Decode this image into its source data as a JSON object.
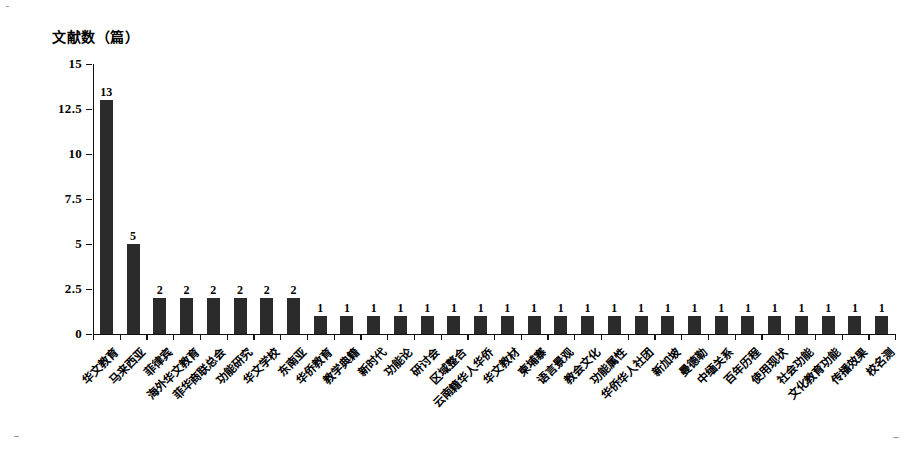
{
  "chart_data": {
    "type": "bar",
    "title": "",
    "subtitle": "",
    "xlabel": "",
    "ylabel": "文献数（篇）",
    "ylim": [
      0,
      15
    ],
    "yticks": [
      "0",
      "2.5",
      "5",
      "7.5",
      "10",
      "12.5",
      "15"
    ],
    "ytick_values": [
      0,
      2.5,
      5,
      7.5,
      10,
      12.5,
      15
    ],
    "grid": false,
    "legend": null,
    "bar_color": "#2b2b2b",
    "categories": [
      "华文教育",
      "马来西亚",
      "菲律宾",
      "海外华文教育",
      "菲华商联总会",
      "功能研究",
      "华文学校",
      "东南亚",
      "华侨教育",
      "教学典籍",
      "新时代",
      "功能论",
      "研讨会",
      "区域整合",
      "云南籍华人华侨",
      "华文教材",
      "柬埔寨",
      "语言景观",
      "教会文化",
      "功能属性",
      "华侨华人社团",
      "新加坡",
      "曼德勒",
      "中缅关系",
      "百年历程",
      "使用现状",
      "社会功能",
      "文化教育功能",
      "传播效果",
      "校名测"
    ],
    "values": [
      13,
      5,
      2,
      2,
      2,
      2,
      2,
      2,
      1,
      1,
      1,
      1,
      1,
      1,
      1,
      1,
      1,
      1,
      1,
      1,
      1,
      1,
      1,
      1,
      1,
      1,
      1,
      1,
      1,
      1
    ],
    "value_labels": [
      "13",
      "5",
      "2",
      "2",
      "2",
      "2",
      "2",
      "2",
      "1",
      "1",
      "1",
      "1",
      "1",
      "1",
      "1",
      "1",
      "1",
      "1",
      "1",
      "1",
      "1",
      "1",
      "1",
      "1",
      "1",
      "1",
      "1",
      "1",
      "1",
      "1"
    ]
  }
}
